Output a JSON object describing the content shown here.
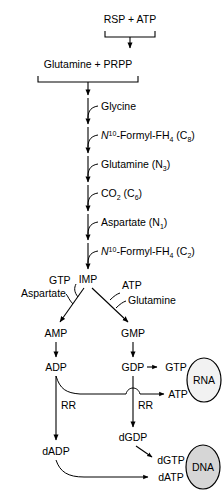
{
  "diagram": {
    "colors": {
      "background": "#ffffff",
      "line": "#000000",
      "text": "#000000",
      "rna_oval_fill": "#f2f2f2",
      "dna_oval_fill": "#d6d6d6"
    },
    "nodes": {
      "rsp_atp": "RSP + ATP",
      "glutamine_prpp": "Glutamine  +  PRPP",
      "imp": "IMP",
      "amp": "AMP",
      "gmp": "GMP",
      "adp": "ADP",
      "gdp": "GDP",
      "gtp": "GTP",
      "atp_to_rna": "ATP",
      "dadp": "dADP",
      "dgdp": "dGDP",
      "dgtp": "dGTP",
      "datp": "dATP",
      "rna": "RNA",
      "dna": "DNA"
    },
    "step_labels": [
      {
        "id": "glycine",
        "text": "Glycine"
      },
      {
        "id": "formyl-fh4-c8",
        "prefix": "N",
        "sup": "10",
        "main": "-Formyl-FH",
        "sub": "4",
        "suffix": " (C",
        "sub2": "8",
        "suffix2": ")"
      },
      {
        "id": "glutamine-n3",
        "main": "Glutamine (N",
        "sub": "3",
        "suffix": ")"
      },
      {
        "id": "co2-c6",
        "main": "CO",
        "sub": "2",
        "suffix": " (C",
        "sub2": "6",
        "suffix2": ")"
      },
      {
        "id": "aspartate-n1",
        "main": "Aspartate (N",
        "sub": "1",
        "suffix": ")"
      },
      {
        "id": "formyl-fh4-c2",
        "prefix": "N",
        "sup": "10",
        "main": "-Formyl-FH",
        "sub": "4",
        "suffix": " (C",
        "sub2": "2",
        "suffix2": ")"
      }
    ],
    "branch_labels": {
      "gtp": "GTP",
      "aspartate": "Aspartate",
      "atp": "ATP",
      "glutamine": "Glutamine"
    },
    "enzyme_labels": {
      "rr_left": "RR",
      "rr_right": "RR"
    }
  }
}
